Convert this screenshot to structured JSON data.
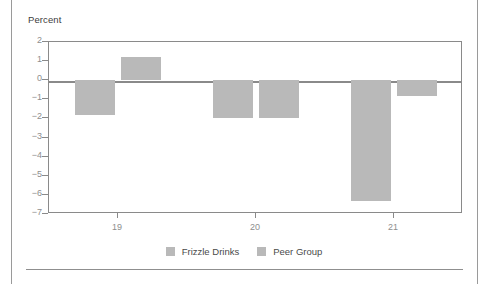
{
  "chart_data": {
    "type": "bar",
    "title": "",
    "subtitle": "",
    "xlabel": "",
    "ylabel": "Percent",
    "categories": [
      "19",
      "20",
      "21"
    ],
    "series": [
      {
        "name": "Frizzle Drinks",
        "values": [
          -1.8,
          -2.0,
          -6.3
        ],
        "color": "#b9b9b9"
      },
      {
        "name": "Peer Group",
        "values": [
          1.2,
          -2.0,
          -0.85
        ],
        "color": "#b9b9b9"
      }
    ],
    "ylim": [
      -7,
      2
    ],
    "yticks": [
      2,
      1,
      0,
      -1,
      -2,
      -3,
      -4,
      -5,
      -6,
      -7
    ],
    "ytick_labels": [
      "2",
      "1",
      "0",
      "−1",
      "−2",
      "−3",
      "−4",
      "−5",
      "−6",
      "−7"
    ],
    "grid": false,
    "zero_line": true,
    "legend_position": "bottom",
    "frame": true
  },
  "legend": {
    "entries": [
      {
        "label": "Frizzle Drinks"
      },
      {
        "label": "Peer Group"
      }
    ]
  },
  "colors": {
    "bar": "#b9b9b9",
    "axis": "#8a8a8a",
    "tick_text": "#8e8e8e",
    "axis_title_text": "#3d3d3d",
    "legend_text": "#4a4a4a",
    "rule": "#9a9a9a",
    "background": "#ffffff"
  }
}
